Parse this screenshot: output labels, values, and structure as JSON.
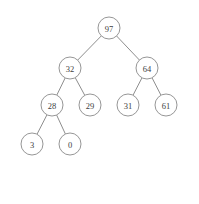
{
  "figure": {
    "type": "binary-tree-with-array",
    "background_color": "#ffffff",
    "stroke_color": "#8a8a8a",
    "text_color": "#3c3c3c"
  },
  "tree": {
    "node_radius": 11,
    "nodes": [
      {
        "id": "n0",
        "label": "97",
        "cx": 109,
        "cy": 28,
        "array_index": 0
      },
      {
        "id": "n1",
        "label": "32",
        "cx": 70,
        "cy": 68,
        "array_index": 1
      },
      {
        "id": "n2",
        "label": "64",
        "cx": 147,
        "cy": 68,
        "array_index": 2
      },
      {
        "id": "n3",
        "label": "28",
        "cx": 52,
        "cy": 105,
        "array_index": 3
      },
      {
        "id": "n4",
        "label": "29",
        "cx": 90,
        "cy": 105,
        "array_index": 4
      },
      {
        "id": "n5",
        "label": "31",
        "cx": 128,
        "cy": 105,
        "array_index": 5
      },
      {
        "id": "n6",
        "label": "61",
        "cx": 166,
        "cy": 105,
        "array_index": 6
      },
      {
        "id": "n7",
        "label": "3",
        "cx": 32,
        "cy": 144,
        "array_index": 7
      },
      {
        "id": "n8",
        "label": "0",
        "cx": 70,
        "cy": 144,
        "array_index": 8
      }
    ],
    "edges": [
      {
        "from": "n0",
        "to": "n1"
      },
      {
        "from": "n0",
        "to": "n2"
      },
      {
        "from": "n1",
        "to": "n3"
      },
      {
        "from": "n1",
        "to": "n4"
      },
      {
        "from": "n2",
        "to": "n5"
      },
      {
        "from": "n2",
        "to": "n6"
      },
      {
        "from": "n3",
        "to": "n7"
      },
      {
        "from": "n3",
        "to": "n8"
      }
    ]
  },
  "array": {
    "name": "a",
    "indices": [
      "[0]",
      "[1]",
      "[2]",
      "[3]",
      "[4]",
      "[5]",
      "[6]",
      "[7]",
      "[8]"
    ],
    "values": [
      "97",
      "32",
      "64",
      "28",
      "29",
      "31",
      "61",
      "3",
      "0"
    ]
  }
}
